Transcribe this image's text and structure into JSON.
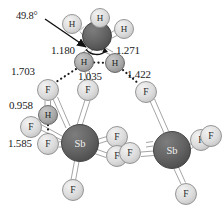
{
  "figure": {
    "type": "molecular-structure-diagram",
    "background_color": "#ffffff",
    "units": "angstrom"
  },
  "colors": {
    "dark_atom_fill": "#5f5f5f",
    "dark_atom_stroke": "#3a3a3a",
    "mid_atom_fill": "#a8a8a8",
    "mid_atom_stroke": "#5f5f5f",
    "light_atom_fill": "#d6d6d6",
    "light_atom_stroke": "#8c8c8c",
    "bond_stroke": "#8f8f8f",
    "dotted_bond": "#1a1a1a",
    "label_text": "#1a1a1a",
    "arrow": "#111111"
  },
  "atoms": [
    {
      "id": "N1",
      "label": "",
      "cx": 97,
      "cy": 36,
      "r": 14.5,
      "shade": "dark",
      "show_label": false
    },
    {
      "id": "H1",
      "label": "H",
      "cx": 72,
      "cy": 24,
      "r": 9.5,
      "shade": "light",
      "show_label": true
    },
    {
      "id": "H2",
      "label": "H",
      "cx": 100,
      "cy": 18,
      "r": 9.5,
      "shade": "light",
      "show_label": true
    },
    {
      "id": "H3",
      "label": "H",
      "cx": 124,
      "cy": 29,
      "r": 9.5,
      "shade": "light",
      "show_label": true
    },
    {
      "id": "H4",
      "label": "H",
      "cx": 84,
      "cy": 62,
      "r": 9.5,
      "shade": "mid",
      "show_label": true
    },
    {
      "id": "H5",
      "label": "H",
      "cx": 115,
      "cy": 63,
      "r": 9.5,
      "shade": "mid",
      "show_label": true
    },
    {
      "id": "F1",
      "label": "F",
      "cx": 48,
      "cy": 90,
      "r": 10.5,
      "shade": "light",
      "show_label": true
    },
    {
      "id": "F2",
      "label": "F",
      "cx": 88,
      "cy": 90,
      "r": 10.5,
      "shade": "light",
      "show_label": true
    },
    {
      "id": "F3",
      "label": "F",
      "cx": 146,
      "cy": 92,
      "r": 10.5,
      "shade": "light",
      "show_label": true
    },
    {
      "id": "H6",
      "label": "H",
      "cx": 48,
      "cy": 115,
      "r": 9.5,
      "shade": "mid",
      "show_label": true
    },
    {
      "id": "F4",
      "label": "F",
      "cx": 31,
      "cy": 127,
      "r": 10.5,
      "shade": "light",
      "show_label": true
    },
    {
      "id": "F5",
      "label": "F",
      "cx": 48,
      "cy": 144,
      "r": 10.5,
      "shade": "light",
      "show_label": true
    },
    {
      "id": "Sb1",
      "label": "Sb",
      "cx": 80,
      "cy": 143,
      "r": 18.5,
      "shade": "dark",
      "show_label": true
    },
    {
      "id": "F6",
      "label": "F",
      "cx": 117,
      "cy": 137,
      "r": 10.5,
      "shade": "light",
      "show_label": true
    },
    {
      "id": "F7",
      "label": "F",
      "cx": 117,
      "cy": 156,
      "r": 10.5,
      "shade": "light",
      "show_label": true
    },
    {
      "id": "F8",
      "label": "F",
      "cx": 130,
      "cy": 153,
      "r": 10.5,
      "shade": "light",
      "show_label": true
    },
    {
      "id": "F9",
      "label": "F",
      "cx": 73,
      "cy": 190,
      "r": 10.5,
      "shade": "light",
      "show_label": true
    },
    {
      "id": "Sb2",
      "label": "Sb",
      "cx": 172,
      "cy": 150,
      "r": 18.5,
      "shade": "dark",
      "show_label": true
    },
    {
      "id": "F10",
      "label": "F",
      "cx": 201,
      "cy": 140,
      "r": 10.5,
      "shade": "light",
      "show_label": true
    },
    {
      "id": "F11",
      "label": "F",
      "cx": 211,
      "cy": 136,
      "r": 10.5,
      "shade": "light",
      "show_label": true
    },
    {
      "id": "F12",
      "label": "F",
      "cx": 186,
      "cy": 194,
      "r": 10.5,
      "shade": "light",
      "show_label": true
    }
  ],
  "measurements": [
    {
      "id": "angle",
      "value": "49.8°",
      "x": 16,
      "y": 11,
      "kind": "angle"
    },
    {
      "id": "d1180",
      "value": "1.180",
      "x": 51,
      "y": 45,
      "kind": "distance"
    },
    {
      "id": "d1271",
      "value": "1.271",
      "x": 116,
      "y": 45,
      "kind": "distance"
    },
    {
      "id": "d1703",
      "value": "1.703",
      "x": 11,
      "y": 66,
      "kind": "distance"
    },
    {
      "id": "d1035",
      "value": "1.035",
      "x": 78,
      "y": 71,
      "kind": "distance"
    },
    {
      "id": "d1422",
      "value": "1.422",
      "x": 127,
      "y": 69,
      "kind": "distance"
    },
    {
      "id": "d0958",
      "value": "0.958",
      "x": 9,
      "y": 100,
      "kind": "distance"
    },
    {
      "id": "d1585",
      "value": "1.585",
      "x": 8,
      "y": 138,
      "kind": "distance"
    }
  ],
  "annotations": {
    "leader_arrow": {
      "from_x": 45,
      "from_y": 20,
      "to_x": 89,
      "to_y": 49,
      "name": "angle-leader-arrow"
    },
    "angle_arc": {
      "name": "bond-angle-arc"
    }
  }
}
